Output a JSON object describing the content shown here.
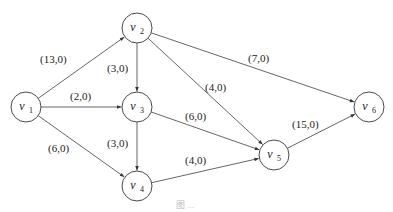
{
  "figure": {
    "type": "directed-network-flow-graph",
    "caption": "图 ..."
  },
  "nodes": [
    {
      "id": "v1",
      "name": "v",
      "sub": "1",
      "x": 26,
      "y": 107
    },
    {
      "id": "v2",
      "name": "v",
      "sub": "2",
      "x": 137,
      "y": 28
    },
    {
      "id": "v3",
      "name": "v",
      "sub": "3",
      "x": 137,
      "y": 107
    },
    {
      "id": "v4",
      "name": "v",
      "sub": "4",
      "x": 137,
      "y": 186
    },
    {
      "id": "v5",
      "name": "v",
      "sub": "5",
      "x": 274,
      "y": 155
    },
    {
      "id": "v6",
      "name": "v",
      "sub": "6",
      "x": 369,
      "y": 107
    }
  ],
  "edges": [
    {
      "from": "v1",
      "to": "v2",
      "label": "(13,0)",
      "lx": 40,
      "ly": 63
    },
    {
      "from": "v1",
      "to": "v3",
      "label": "(2,0)",
      "lx": 70,
      "ly": 100
    },
    {
      "from": "v1",
      "to": "v4",
      "label": "(6,0)",
      "lx": 48,
      "ly": 152
    },
    {
      "from": "v2",
      "to": "v3",
      "label": "(3,0)",
      "lx": 107,
      "ly": 72
    },
    {
      "from": "v2",
      "to": "v5",
      "label": "(4,0)",
      "lx": 205,
      "ly": 91
    },
    {
      "from": "v2",
      "to": "v6",
      "label": "(7,0)",
      "lx": 248,
      "ly": 62
    },
    {
      "from": "v3",
      "to": "v4",
      "label": "(3,0)",
      "lx": 107,
      "ly": 147
    },
    {
      "from": "v3",
      "to": "v5",
      "label": "(6,0)",
      "lx": 185,
      "ly": 120
    },
    {
      "from": "v4",
      "to": "v5",
      "label": "(4,0)",
      "lx": 185,
      "ly": 164
    },
    {
      "from": "v5",
      "to": "v6",
      "label": "(15,0)",
      "lx": 292,
      "ly": 128
    }
  ],
  "style": {
    "node_radius": 15,
    "stroke_color": "#4a4a4a",
    "edge_color": "#555555"
  }
}
